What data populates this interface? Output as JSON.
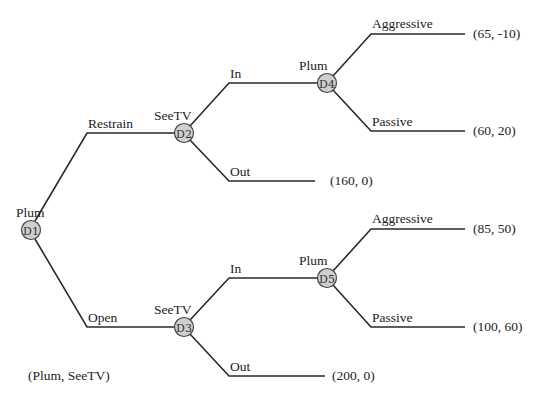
{
  "diagram": {
    "type": "game-tree",
    "caption": "(Plum, SeeTV)",
    "nodes": [
      {
        "id": "D1",
        "player": "Plum",
        "x": 31,
        "y": 230
      },
      {
        "id": "D2",
        "player": "SeeTV",
        "x": 184,
        "y": 133
      },
      {
        "id": "D3",
        "player": "SeeTV",
        "x": 184,
        "y": 327
      },
      {
        "id": "D4",
        "player": "Plum",
        "x": 327,
        "y": 83
      },
      {
        "id": "D5",
        "player": "Plum",
        "x": 327,
        "y": 278
      }
    ],
    "edges": [
      {
        "from": "D1",
        "label": "Restrain",
        "to": "D2"
      },
      {
        "from": "D1",
        "label": "Open",
        "to": "D3"
      },
      {
        "from": "D2",
        "label": "In",
        "to": "D4"
      },
      {
        "from": "D2",
        "label": "Out",
        "payoff": "(160, 0)"
      },
      {
        "from": "D4",
        "label": "Aggressive",
        "payoff": "(65, -10)"
      },
      {
        "from": "D4",
        "label": "Passive",
        "payoff": "(60, 20)"
      },
      {
        "from": "D3",
        "label": "In",
        "to": "D5"
      },
      {
        "from": "D3",
        "label": "Out",
        "payoff": "(200, 0)"
      },
      {
        "from": "D5",
        "label": "Aggressive",
        "payoff": "(85, 50)"
      },
      {
        "from": "D5",
        "label": "Passive",
        "payoff": "(100, 60)"
      }
    ]
  },
  "labels": {
    "d1_player": "Plum",
    "d1_id": "D1",
    "d2_player": "SeeTV",
    "d2_id": "D2",
    "d3_player": "SeeTV",
    "d3_id": "D3",
    "d4_player": "Plum",
    "d4_id": "D4",
    "d5_player": "Plum",
    "d5_id": "D5",
    "restrain": "Restrain",
    "open": "Open",
    "d2_in": "In",
    "d2_out": "Out",
    "d3_in": "In",
    "d3_out": "Out",
    "d4_aggressive": "Aggressive",
    "d4_passive": "Passive",
    "d5_aggressive": "Aggressive",
    "d5_passive": "Passive",
    "payoff_d4_aggressive": "(65, -10)",
    "payoff_d4_passive": "(60, 20)",
    "payoff_d2_out": "(160, 0)",
    "payoff_d5_aggressive": "(85, 50)",
    "payoff_d5_passive": "(100, 60)",
    "payoff_d3_out": "(200, 0)",
    "caption": "(Plum, SeeTV)"
  }
}
